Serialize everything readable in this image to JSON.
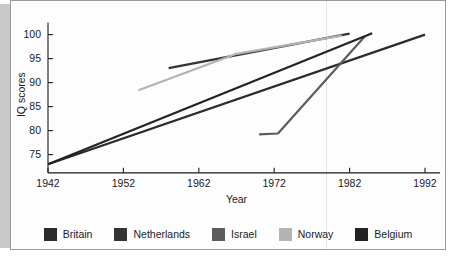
{
  "chart_data": {
    "type": "line",
    "title": "",
    "xlabel": "Year",
    "ylabel": "IQ scores",
    "xlim": [
      1942,
      1992
    ],
    "ylim": [
      72,
      102
    ],
    "xticks": [
      1942,
      1952,
      1962,
      1972,
      1982,
      1992
    ],
    "yticks": [
      75,
      80,
      85,
      90,
      95,
      100
    ],
    "grid": false,
    "legend_position": "bottom",
    "series": [
      {
        "name": "Britain",
        "color": "#2b2b2b",
        "x": [
          1942,
          1992
        ],
        "y": [
          73.0,
          100.0
        ]
      },
      {
        "name": "Netherlands",
        "color": "#333333",
        "x": [
          1958,
          1982
        ],
        "y": [
          93.0,
          100.2
        ]
      },
      {
        "name": "Israel",
        "color": "#5c5c5c",
        "x": [
          1970,
          1972.5,
          1984
        ],
        "y": [
          79.2,
          79.4,
          99.6
        ]
      },
      {
        "name": "Norway",
        "color": "#b3b3b3",
        "x": [
          1954,
          1967,
          1981
        ],
        "y": [
          88.4,
          96.0,
          99.8
        ]
      },
      {
        "name": "Belgium",
        "color": "#232323",
        "x": [
          1942,
          1985
        ],
        "y": [
          73.0,
          100.3
        ]
      }
    ]
  },
  "axes": {
    "y_title": "IQ scores",
    "x_title": "Year",
    "y_tick_labels": [
      "75",
      "80",
      "85",
      "90",
      "95",
      "100"
    ],
    "x_tick_labels": [
      "1942",
      "1952",
      "1962",
      "1972",
      "1982",
      "1992"
    ]
  },
  "legend": {
    "items": [
      {
        "label": "Britain",
        "color": "#2b2b2b"
      },
      {
        "label": "Netherlands",
        "color": "#333333"
      },
      {
        "label": "Israel",
        "color": "#5c5c5c"
      },
      {
        "label": "Norway",
        "color": "#b3b3b3"
      },
      {
        "label": "Belgium",
        "color": "#232323"
      }
    ]
  },
  "style": {
    "background": "#fdfdfd",
    "frame_border": "#9a9a9a",
    "axis_color": "#1a1a1a",
    "shadow": "#c9c9c9"
  }
}
